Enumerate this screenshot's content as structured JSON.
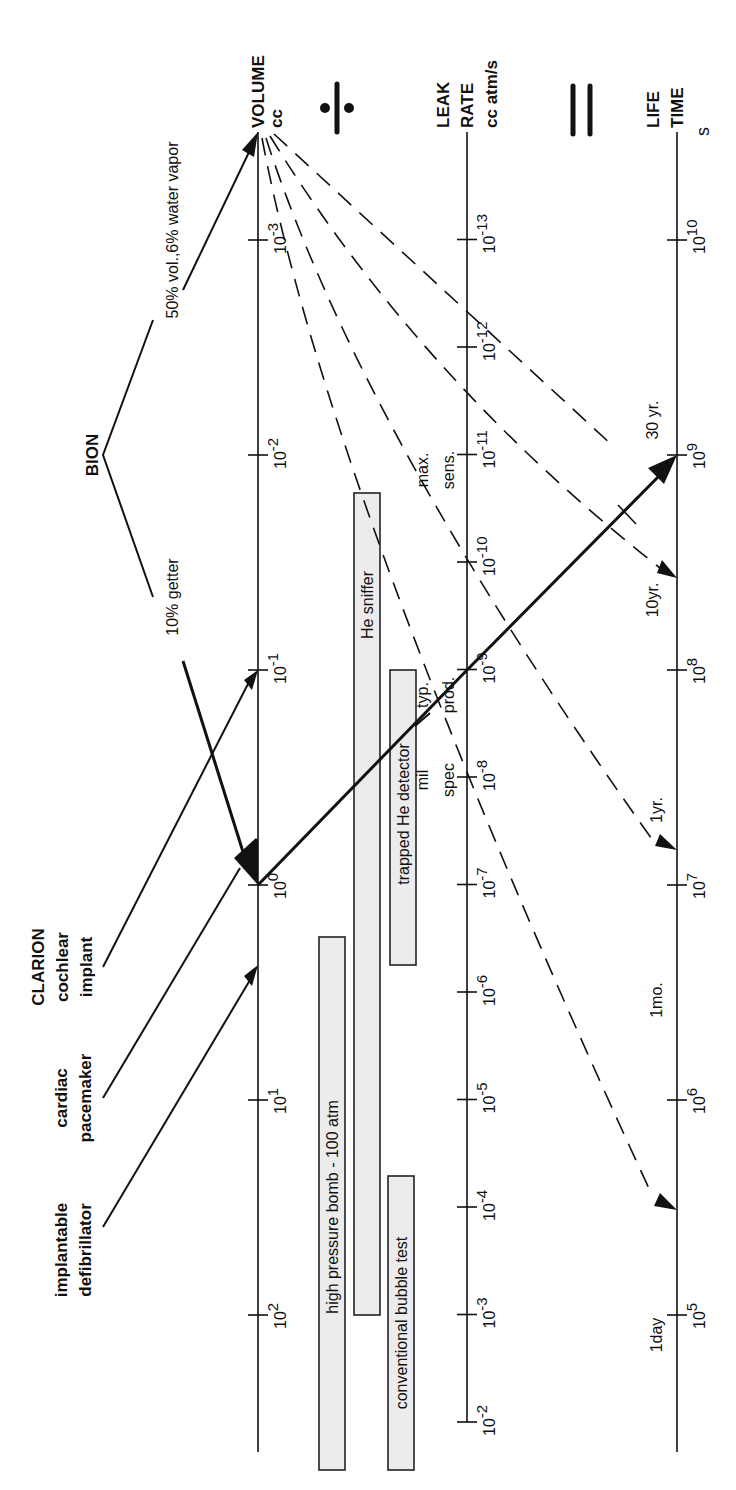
{
  "axes": {
    "volume": {
      "title": [
        "VOLUME",
        "cc"
      ],
      "ticks": [
        {
          "exp": -3,
          "label": "10",
          "sup": "-3"
        },
        {
          "exp": -2,
          "label": "10",
          "sup": "-2"
        },
        {
          "exp": -1,
          "label": "10",
          "sup": "-1"
        },
        {
          "exp": 0,
          "label": "10",
          "sup": "0"
        },
        {
          "exp": 1,
          "label": "10",
          "sup": "1"
        },
        {
          "exp": 2,
          "label": "10",
          "sup": "2"
        }
      ]
    },
    "leak_rate": {
      "title": [
        "LEAK",
        "RATE",
        "cc atm/s"
      ],
      "ticks": [
        {
          "exp": -13,
          "label": "10",
          "sup": "-13"
        },
        {
          "exp": -12,
          "label": "10",
          "sup": "-12"
        },
        {
          "exp": -11,
          "label": "10",
          "sup": "-11"
        },
        {
          "exp": -10,
          "label": "10",
          "sup": "-10"
        },
        {
          "exp": -9,
          "label": "10",
          "sup": "-9"
        },
        {
          "exp": -8,
          "label": "10",
          "sup": "-8"
        },
        {
          "exp": -7,
          "label": "10",
          "sup": "-7"
        },
        {
          "exp": -6,
          "label": "10",
          "sup": "-6"
        },
        {
          "exp": -5,
          "label": "10",
          "sup": "-5"
        },
        {
          "exp": -4,
          "label": "10",
          "sup": "-4"
        },
        {
          "exp": -3,
          "label": "10",
          "sup": "-3"
        },
        {
          "exp": -2,
          "label": "10",
          "sup": "-2"
        }
      ]
    },
    "lifetime": {
      "title": [
        "LIFE",
        "TIME",
        "s"
      ],
      "ticks": [
        {
          "exp": 10,
          "label": "10",
          "sup": "10"
        },
        {
          "exp": 9,
          "label": "10",
          "sup": "9"
        },
        {
          "exp": 8,
          "label": "10",
          "sup": "8"
        },
        {
          "exp": 7,
          "label": "10",
          "sup": "7"
        },
        {
          "exp": 6,
          "label": "10",
          "sup": "6"
        },
        {
          "exp": 5,
          "label": "10",
          "sup": "5"
        }
      ]
    }
  },
  "operators": {
    "divide": "÷",
    "equals": "="
  },
  "devices": [
    {
      "name": [
        "CLARION",
        "cochlear",
        "implant"
      ],
      "volume_cc": 0.1
    },
    {
      "name": [
        "cardiac",
        "pacemaker"
      ],
      "volume_cc": 1
    },
    {
      "name": [
        "implantable",
        "defibrillator"
      ],
      "volume_cc": 5
    }
  ],
  "bion": {
    "title": "BION",
    "getter_label": "10% getter",
    "vapor_label": "50% vol.,6% water vapor",
    "getter_volume_cc": 1,
    "vapor_volume_cc": 0.0005
  },
  "leak_annotations": {
    "max_sens": [
      "max.",
      "sens."
    ],
    "typ_prod": [
      "typ.",
      "prod."
    ],
    "mil_spec": [
      "mil",
      "spec"
    ]
  },
  "lifetime_annotations": {
    "y30": "30 yr.",
    "y10": "10yr.",
    "y1": "1yr.",
    "mo1": "1mo.",
    "day1": "1day"
  },
  "test_methods": [
    {
      "label": "He sniffer",
      "range_exp": [
        -11.5,
        -3.5
      ]
    },
    {
      "label": "trapped He detector",
      "range_exp": [
        -9,
        -6.2
      ]
    },
    {
      "label": "high pressure bomb - 100 atm",
      "range_exp": [
        -6.5,
        -1.5
      ]
    },
    {
      "label": "conventional bubble test",
      "range_exp": [
        -4,
        -1.5
      ]
    }
  ]
}
